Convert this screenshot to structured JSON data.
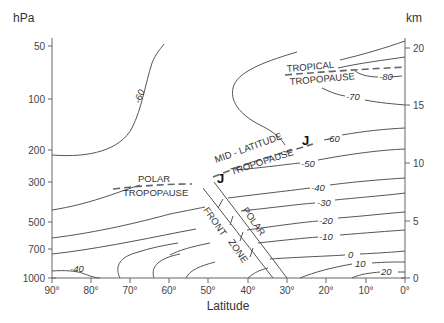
{
  "diagram": {
    "left_axis": {
      "unit": "hPa",
      "ticks": [
        {
          "label": "50",
          "y": 46
        },
        {
          "label": "100",
          "y": 99
        },
        {
          "label": "200",
          "y": 150
        },
        {
          "label": "300",
          "y": 182
        },
        {
          "label": "500",
          "y": 222
        },
        {
          "label": "700",
          "y": 249
        },
        {
          "label": "1000",
          "y": 278
        }
      ]
    },
    "right_axis": {
      "unit": "km",
      "ticks": [
        {
          "label": "20",
          "y": 48
        },
        {
          "label": "15",
          "y": 105
        },
        {
          "label": "10",
          "y": 163
        },
        {
          "label": "5",
          "y": 221
        },
        {
          "label": "0",
          "y": 278
        }
      ]
    },
    "x_axis": {
      "title": "Latitude",
      "ticks": [
        "90°",
        "80°",
        "70°",
        "60°",
        "50°",
        "40°",
        "30°",
        "20°",
        "10°",
        "0°"
      ]
    },
    "labels": {
      "polar_1": "POLAR",
      "polar_2": "TROPOPAUSE",
      "mid_1": "MID - LATITUDE",
      "mid_2": "TROPOPAUSE",
      "tropical_1": "TROPICAL",
      "tropical_2": "TROPOPAUSE",
      "front_1": "FRONT",
      "front_2": "ZONE",
      "polar_front": "POLAR",
      "jet_1": "J",
      "jet_2": "J"
    },
    "contour_labels": {
      "m60_left": "-60",
      "m80": "-80",
      "m70": "-70",
      "m60": "-60",
      "m50": "-50",
      "m40": "-40",
      "m30": "-30",
      "m20": "-20",
      "m10": "-10",
      "z0": "0",
      "p10": "10",
      "p20": "20",
      "m40_bottom": "-40"
    }
  }
}
